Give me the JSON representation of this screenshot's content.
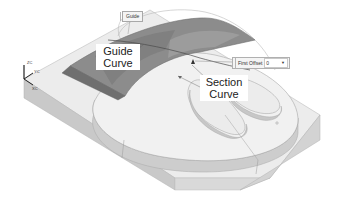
{
  "viewport": {
    "background": "#ffffff"
  },
  "callouts": {
    "guide_curve": {
      "line1": "Guide",
      "line2": "Curve"
    },
    "section_curve": {
      "line1": "Section",
      "line2": "Curve"
    }
  },
  "screen_tags": {
    "guide_tag": "Guide",
    "first_offset": {
      "label": "First Offset",
      "value": "0",
      "dropdown_icon": "chevron-down-icon"
    }
  },
  "triad": {
    "z_label": "ZC",
    "y_label": "YC",
    "x_label": "XC"
  },
  "colors": {
    "block_top": "#ececec",
    "block_side_front": "#c9c9c9",
    "block_side_right": "#dadada",
    "boss_top": "#f2f2f2",
    "boss_wall": "#cfcfcf",
    "sweep_surface_dark": "#7d7d7d",
    "sweep_surface_mid": "#8f8f8f",
    "sweep_surface_light": "#a3a3a3",
    "edge_line": "#9a9a9a"
  }
}
